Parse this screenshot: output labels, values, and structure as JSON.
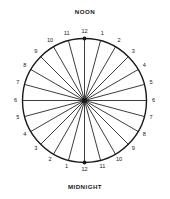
{
  "figure": {
    "name": "24-hour-clock-wheel",
    "top_label": "NOON",
    "bottom_label": "MIDNIGHT",
    "stroke_color": "#1a1a1a",
    "background_color": "#ffffff",
    "center_x": 84.5,
    "center_y": 100.5,
    "radius": 62,
    "spoke_count": 24,
    "label_radius": 69
  },
  "chart_data": {
    "type": "pie",
    "title": "",
    "categories": [
      "12",
      "1",
      "2",
      "3",
      "4",
      "5",
      "6",
      "7",
      "8",
      "9",
      "10",
      "11",
      "12",
      "1",
      "2",
      "3",
      "4",
      "5",
      "6",
      "7",
      "8",
      "9",
      "10",
      "11"
    ],
    "values": [
      1,
      1,
      1,
      1,
      1,
      1,
      1,
      1,
      1,
      1,
      1,
      1,
      1,
      1,
      1,
      1,
      1,
      1,
      1,
      1,
      1,
      1,
      1,
      1
    ],
    "grid": false,
    "legend": "none"
  },
  "hours": [
    {
      "label": "12",
      "angle_deg": 0,
      "marker": true
    },
    {
      "label": "1",
      "angle_deg": 15,
      "marker": false
    },
    {
      "label": "2",
      "angle_deg": 30,
      "marker": false
    },
    {
      "label": "3",
      "angle_deg": 45,
      "marker": false
    },
    {
      "label": "4",
      "angle_deg": 60,
      "marker": false
    },
    {
      "label": "5",
      "angle_deg": 75,
      "marker": false
    },
    {
      "label": "6",
      "angle_deg": 90,
      "marker": false
    },
    {
      "label": "7",
      "angle_deg": 105,
      "marker": false
    },
    {
      "label": "8",
      "angle_deg": 120,
      "marker": false
    },
    {
      "label": "9",
      "angle_deg": 135,
      "marker": false
    },
    {
      "label": "10",
      "angle_deg": 150,
      "marker": false
    },
    {
      "label": "11",
      "angle_deg": 165,
      "marker": false
    },
    {
      "label": "12",
      "angle_deg": 180,
      "marker": true
    },
    {
      "label": "1",
      "angle_deg": 195,
      "marker": false
    },
    {
      "label": "2",
      "angle_deg": 210,
      "marker": false
    },
    {
      "label": "3",
      "angle_deg": 225,
      "marker": false
    },
    {
      "label": "4",
      "angle_deg": 240,
      "marker": false
    },
    {
      "label": "5",
      "angle_deg": 255,
      "marker": false
    },
    {
      "label": "6",
      "angle_deg": 270,
      "marker": false
    },
    {
      "label": "7",
      "angle_deg": 285,
      "marker": false
    },
    {
      "label": "8",
      "angle_deg": 300,
      "marker": false
    },
    {
      "label": "9",
      "angle_deg": 315,
      "marker": false
    },
    {
      "label": "10",
      "angle_deg": 330,
      "marker": false
    },
    {
      "label": "11",
      "angle_deg": 345,
      "marker": false
    }
  ]
}
